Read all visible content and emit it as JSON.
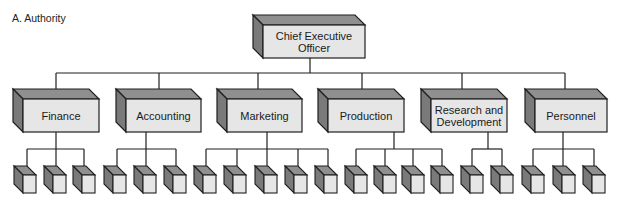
{
  "title": "A. Authority",
  "colors": {
    "front": "#e6e6e6",
    "top": "#8f8f8f",
    "side": "#7a7a7a",
    "line": "#1f1f1f"
  },
  "ceo": {
    "label": "Chief Executive Officer",
    "line1": "Chief Executive",
    "line2": "Officer"
  },
  "departments": [
    {
      "label": "Finance",
      "subunits": 3
    },
    {
      "label": "Accounting",
      "subunits": 3
    },
    {
      "label": "Marketing",
      "subunits": 5
    },
    {
      "label": "Production",
      "subunits": 4
    },
    {
      "label": "Research and Development",
      "line1": "Research and",
      "line2": "Development",
      "subunits": 2
    },
    {
      "label": "Personnel",
      "subunits": 3
    }
  ]
}
